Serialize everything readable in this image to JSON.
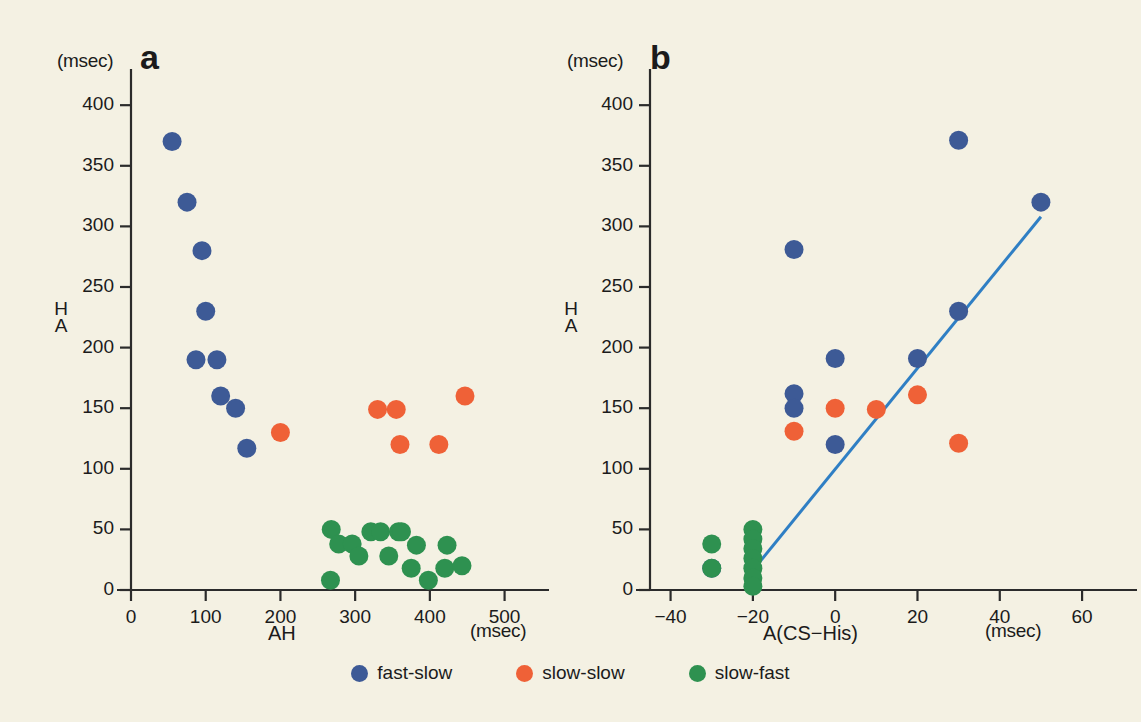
{
  "figure": {
    "background_color": "#f4f1e3",
    "colors": {
      "fast_slow": "#3d5a96",
      "slow_slow": "#ef6137",
      "slow_fast": "#2e9150",
      "axis": "#2b2b2b",
      "fit_line": "#2f7fc4"
    }
  },
  "legend": {
    "items": [
      {
        "label": "fast-slow",
        "color": "#3d5a96",
        "marker": "circle"
      },
      {
        "label": "slow-slow",
        "color": "#ef6137",
        "marker": "circle"
      },
      {
        "label": "slow-fast",
        "color": "#2e9150",
        "marker": "circle"
      }
    ]
  },
  "chart_data": [
    {
      "type": "scatter",
      "panel": "a",
      "panel_letter": "a",
      "title": "",
      "xlabel": "AH",
      "ylabel": "H\nA",
      "ylabel_lines": [
        "H",
        "A"
      ],
      "x_unit": "(msec)",
      "y_unit": "(msec)",
      "xlim": [
        0,
        530
      ],
      "ylim": [
        0,
        415
      ],
      "xticks": [
        0,
        100,
        200,
        300,
        400,
        500
      ],
      "xtick_labels": [
        "0",
        "100",
        "200",
        "300",
        "400",
        "500"
      ],
      "yticks": [
        0,
        50,
        100,
        150,
        200,
        250,
        300,
        350,
        400
      ],
      "ytick_labels": [
        "0",
        "50",
        "100",
        "150",
        "200",
        "250",
        "300",
        "350",
        "400"
      ],
      "grid": false,
      "legend_position": "below-figure",
      "series": [
        {
          "name": "fast-slow",
          "color": "#3d5a96",
          "points": [
            {
              "x": 55,
              "y": 370
            },
            {
              "x": 75,
              "y": 320
            },
            {
              "x": 95,
              "y": 280
            },
            {
              "x": 100,
              "y": 230
            },
            {
              "x": 87,
              "y": 190
            },
            {
              "x": 115,
              "y": 190
            },
            {
              "x": 120,
              "y": 160
            },
            {
              "x": 140,
              "y": 150
            },
            {
              "x": 155,
              "y": 117
            }
          ]
        },
        {
          "name": "slow-slow",
          "color": "#ef6137",
          "points": [
            {
              "x": 200,
              "y": 130
            },
            {
              "x": 330,
              "y": 149
            },
            {
              "x": 355,
              "y": 149
            },
            {
              "x": 360,
              "y": 120
            },
            {
              "x": 412,
              "y": 120
            },
            {
              "x": 447,
              "y": 160
            }
          ]
        },
        {
          "name": "slow-fast",
          "color": "#2e9150",
          "points": [
            {
              "x": 267,
              "y": 8
            },
            {
              "x": 268,
              "y": 50
            },
            {
              "x": 278,
              "y": 38
            },
            {
              "x": 296,
              "y": 38
            },
            {
              "x": 305,
              "y": 28
            },
            {
              "x": 321,
              "y": 48
            },
            {
              "x": 334,
              "y": 48
            },
            {
              "x": 345,
              "y": 28
            },
            {
              "x": 358,
              "y": 48
            },
            {
              "x": 362,
              "y": 48
            },
            {
              "x": 375,
              "y": 18
            },
            {
              "x": 382,
              "y": 37
            },
            {
              "x": 398,
              "y": 8
            },
            {
              "x": 420,
              "y": 18
            },
            {
              "x": 423,
              "y": 37
            },
            {
              "x": 443,
              "y": 20
            }
          ]
        }
      ]
    },
    {
      "type": "scatter",
      "panel": "b",
      "panel_letter": "b",
      "title": "",
      "xlabel": "A(CS−His)",
      "ylabel": "H\nA",
      "ylabel_lines": [
        "H",
        "A"
      ],
      "x_unit": "(msec)",
      "y_unit": "(msec)",
      "xlim": [
        -45,
        68
      ],
      "ylim": [
        0,
        415
      ],
      "xticks": [
        -40,
        -20,
        0,
        20,
        40,
        60
      ],
      "xtick_labels": [
        "−40",
        "−20",
        "0",
        "20",
        "40",
        "60"
      ],
      "yticks": [
        0,
        50,
        100,
        150,
        200,
        250,
        300,
        350,
        400
      ],
      "ytick_labels": [
        "0",
        "50",
        "100",
        "150",
        "200",
        "250",
        "300",
        "350",
        "400"
      ],
      "grid": false,
      "legend_position": "below-figure",
      "fit_line": {
        "name": "regression",
        "color": "#2f7fc4",
        "x1": -22,
        "y1": 8,
        "x2": 50,
        "y2": 308
      },
      "series": [
        {
          "name": "fast-slow",
          "color": "#3d5a96",
          "points": [
            {
              "x": 30,
              "y": 371
            },
            {
              "x": 50,
              "y": 320
            },
            {
              "x": -10,
              "y": 281
            },
            {
              "x": 30,
              "y": 230
            },
            {
              "x": 0,
              "y": 191
            },
            {
              "x": 20,
              "y": 191
            },
            {
              "x": -10,
              "y": 162
            },
            {
              "x": -10,
              "y": 150
            },
            {
              "x": 0,
              "y": 120
            },
            {
              "x": -30,
              "y": 18
            }
          ]
        },
        {
          "name": "slow-slow",
          "color": "#ef6137",
          "points": [
            {
              "x": -10,
              "y": 131
            },
            {
              "x": 0,
              "y": 150
            },
            {
              "x": 10,
              "y": 149
            },
            {
              "x": 20,
              "y": 161
            },
            {
              "x": 30,
              "y": 121
            }
          ]
        },
        {
          "name": "slow-fast",
          "color": "#2e9150",
          "points": [
            {
              "x": -30,
              "y": 38
            },
            {
              "x": -30,
              "y": 18
            },
            {
              "x": -20,
              "y": 50
            },
            {
              "x": -20,
              "y": 42
            },
            {
              "x": -20,
              "y": 34
            },
            {
              "x": -20,
              "y": 26
            },
            {
              "x": -20,
              "y": 18
            },
            {
              "x": -20,
              "y": 10
            },
            {
              "x": -20,
              "y": 3
            }
          ]
        }
      ]
    }
  ]
}
